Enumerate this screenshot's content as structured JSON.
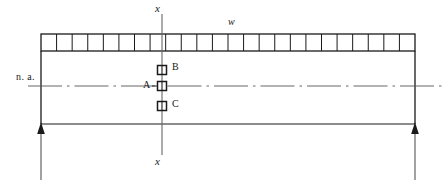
{
  "diagram": {
    "labels": {
      "section_top": "x",
      "section_bottom": "x",
      "load": "w",
      "neutral_axis": "n. a.",
      "point_a": "A",
      "point_b": "B",
      "point_c": "C"
    },
    "colors": {
      "stroke": "#1a1a1a",
      "light_stroke": "#555555",
      "background": "#ffffff"
    },
    "geometry": {
      "beam_left": 41,
      "beam_right": 415,
      "beam_top": 51,
      "beam_bottom": 124,
      "load_strip_top": 34,
      "load_strip_bottom": 51,
      "load_cell_count": 24,
      "neutral_axis_y": 86,
      "section_line_x": 162,
      "section_line_top": 14,
      "section_line_bottom": 155,
      "point_b_y": 70,
      "point_a_y": 86,
      "point_c_y": 106,
      "marker_size": 9,
      "support_left_x": 41,
      "support_right_x": 415,
      "support_line_bottom": 180
    }
  }
}
